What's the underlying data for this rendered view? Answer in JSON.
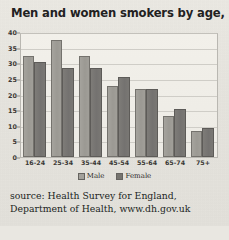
{
  "chart_data": {
    "type": "bar",
    "title": "Men and women smokers by age, 2003",
    "xlabel": "",
    "ylabel": "",
    "ylim": [
      0,
      40
    ],
    "yticks": [
      0,
      5,
      10,
      15,
      20,
      25,
      30,
      35,
      40
    ],
    "grid": true,
    "legend_position": "bottom",
    "categories": [
      "16-24",
      "25-34",
      "35-44",
      "45-54",
      "55-64",
      "65-74",
      "75+"
    ],
    "series": [
      {
        "name": "Male",
        "color": "#9e9c96",
        "values": [
          33,
          38,
          33,
          23,
          22,
          13.5,
          8.5
        ]
      },
      {
        "name": "Female",
        "color": "#76746f",
        "values": [
          31,
          29,
          29,
          26,
          22,
          15.5,
          9.5
        ]
      }
    ]
  },
  "source": {
    "line1": "source: Health Survey for England, Department",
    "line2": "of Health, www.dh.gov.uk"
  }
}
